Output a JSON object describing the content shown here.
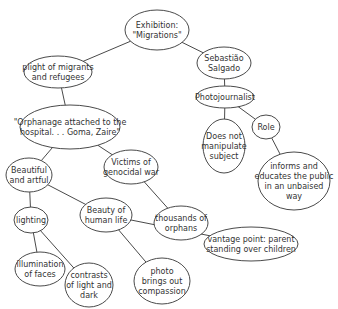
{
  "diagram": {
    "type": "concept-map",
    "nodes": [
      {
        "id": "exhibition",
        "lines": [
          "Exhibition:",
          "\"Migrations\""
        ],
        "cx": 157,
        "cy": 30,
        "rx": 32,
        "ry": 20
      },
      {
        "id": "plight",
        "lines": [
          "plight of migrants",
          "and refugees"
        ],
        "cx": 58,
        "cy": 72,
        "rx": 34,
        "ry": 16
      },
      {
        "id": "salgado",
        "lines": [
          "Sebastião",
          "Salgado"
        ],
        "cx": 224,
        "cy": 63,
        "rx": 27,
        "ry": 16
      },
      {
        "id": "photojournalist",
        "lines": [
          "Photojournalist"
        ],
        "cx": 225,
        "cy": 97,
        "rx": 29,
        "ry": 11
      },
      {
        "id": "orphanage",
        "lines": [
          "\"Orphanage attached to the",
          "hospital. . . Goma, Zaire\""
        ],
        "cx": 70,
        "cy": 127,
        "rx": 50,
        "ry": 22
      },
      {
        "id": "does-not-manipulate",
        "lines": [
          "Does not",
          "manipulate",
          "subject"
        ],
        "cx": 224,
        "cy": 146,
        "rx": 21,
        "ry": 27
      },
      {
        "id": "role",
        "lines": [
          "Role"
        ],
        "cx": 266,
        "cy": 127,
        "rx": 14,
        "ry": 12
      },
      {
        "id": "beautiful-artful",
        "lines": [
          "Beautiful",
          "and artful"
        ],
        "cx": 29,
        "cy": 175,
        "rx": 23,
        "ry": 17
      },
      {
        "id": "victims",
        "lines": [
          "Victims of",
          "genocidal war"
        ],
        "cx": 131,
        "cy": 167,
        "rx": 27,
        "ry": 17
      },
      {
        "id": "informs",
        "lines": [
          "informs and",
          "educates the public",
          "in an unbaised",
          "way"
        ],
        "cx": 294,
        "cy": 181,
        "rx": 36,
        "ry": 29
      },
      {
        "id": "thousands",
        "lines": [
          "thousands of",
          "orphans"
        ],
        "cx": 181,
        "cy": 223,
        "rx": 27,
        "ry": 17
      },
      {
        "id": "lighting",
        "lines": [
          "lighting"
        ],
        "cx": 31,
        "cy": 220,
        "rx": 17,
        "ry": 13
      },
      {
        "id": "beauty-human-life",
        "lines": [
          "Beauty of",
          "human life"
        ],
        "cx": 106,
        "cy": 215,
        "rx": 26,
        "ry": 17
      },
      {
        "id": "illumination",
        "lines": [
          "illumination",
          "of faces"
        ],
        "cx": 40,
        "cy": 269,
        "rx": 25,
        "ry": 17
      },
      {
        "id": "contrasts",
        "lines": [
          "contrasts",
          "of light and",
          "dark"
        ],
        "cx": 89,
        "cy": 285,
        "rx": 24,
        "ry": 22
      },
      {
        "id": "compassion",
        "lines": [
          "photo",
          "brings out",
          "compassion"
        ],
        "cx": 162,
        "cy": 281,
        "rx": 28,
        "ry": 23
      },
      {
        "id": "vantage",
        "lines": [
          "vantage point: parent",
          "standing over children"
        ],
        "cx": 251,
        "cy": 244,
        "rx": 47,
        "ry": 17
      }
    ],
    "edges": [
      {
        "from": "exhibition",
        "to": "plight"
      },
      {
        "from": "exhibition",
        "to": "salgado"
      },
      {
        "from": "salgado",
        "to": "photojournalist"
      },
      {
        "from": "photojournalist",
        "to": "does-not-manipulate"
      },
      {
        "from": "photojournalist",
        "to": "role"
      },
      {
        "from": "role",
        "to": "informs"
      },
      {
        "from": "plight",
        "to": "orphanage"
      },
      {
        "from": "orphanage",
        "to": "beautiful-artful"
      },
      {
        "from": "orphanage",
        "to": "victims"
      },
      {
        "from": "victims",
        "to": "thousands"
      },
      {
        "from": "beautiful-artful",
        "to": "lighting"
      },
      {
        "from": "beautiful-artful",
        "to": "beauty-human-life"
      },
      {
        "from": "lighting",
        "to": "illumination"
      },
      {
        "from": "lighting",
        "to": "contrasts"
      },
      {
        "from": "beauty-human-life",
        "to": "compassion"
      },
      {
        "from": "beauty-human-life",
        "to": "vantage"
      }
    ],
    "colors": {
      "stroke": "#4a4a4a",
      "text": "#333333",
      "background": "#ffffff"
    }
  }
}
